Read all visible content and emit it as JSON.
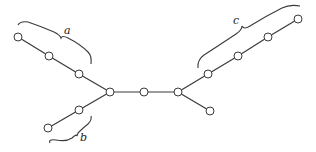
{
  "diagram": {
    "type": "tree",
    "nodes": [
      {
        "id": "n1",
        "x": 18,
        "y": 37
      },
      {
        "id": "n2",
        "x": 49,
        "y": 56
      },
      {
        "id": "n3",
        "x": 79,
        "y": 74
      },
      {
        "id": "n4",
        "x": 110,
        "y": 92
      },
      {
        "id": "n5",
        "x": 144,
        "y": 92
      },
      {
        "id": "n6",
        "x": 178,
        "y": 92
      },
      {
        "id": "n7",
        "x": 79,
        "y": 110
      },
      {
        "id": "n8",
        "x": 48,
        "y": 128
      },
      {
        "id": "n9",
        "x": 208,
        "y": 74
      },
      {
        "id": "n10",
        "x": 238,
        "y": 56
      },
      {
        "id": "n11",
        "x": 268,
        "y": 37
      },
      {
        "id": "n12",
        "x": 298,
        "y": 19
      },
      {
        "id": "n13",
        "x": 210,
        "y": 111
      }
    ],
    "edges": [
      [
        "n1",
        "n2"
      ],
      [
        "n2",
        "n3"
      ],
      [
        "n3",
        "n4"
      ],
      [
        "n4",
        "n5"
      ],
      [
        "n5",
        "n6"
      ],
      [
        "n4",
        "n7"
      ],
      [
        "n7",
        "n8"
      ],
      [
        "n6",
        "n9"
      ],
      [
        "n9",
        "n10"
      ],
      [
        "n10",
        "n11"
      ],
      [
        "n11",
        "n12"
      ],
      [
        "n6",
        "n13"
      ]
    ],
    "braces": [
      {
        "label": "a",
        "covers": [
          "n1",
          "n2",
          "n3"
        ]
      },
      {
        "label": "b",
        "covers": [
          "n7",
          "n8"
        ]
      },
      {
        "label": "c",
        "covers": [
          "n9",
          "n10",
          "n11",
          "n12"
        ]
      }
    ],
    "labels": {
      "a": "a",
      "b": "b",
      "c": "c"
    }
  }
}
